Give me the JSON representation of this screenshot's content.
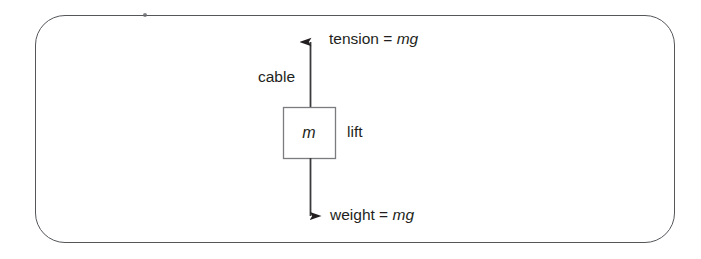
{
  "figure": {
    "name": "lift-force-diagram",
    "background_color": "#ffffff",
    "stroke_color": "#54565a",
    "text_color": "#231f20"
  },
  "frame": {
    "shape": "rounded-rectangle",
    "border_color": "#54565a"
  },
  "diagram": {
    "tension": {
      "label_prefix": "tension = ",
      "label_variable": "mg",
      "arrow_direction": "up",
      "arrow_name": "tension-arrow"
    },
    "cable": {
      "label": "cable",
      "line_name": "cable-line"
    },
    "lift": {
      "mass_symbol": "m",
      "label": "lift",
      "box_name": "lift-box"
    },
    "weight": {
      "label_prefix": "weight = ",
      "label_variable": "mg",
      "arrow_direction": "down",
      "arrow_name": "weight-arrow"
    }
  }
}
